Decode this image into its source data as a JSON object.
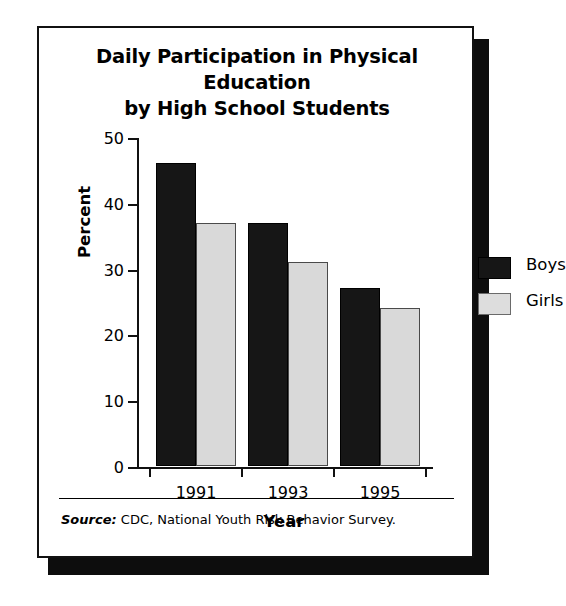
{
  "chart_data": {
    "type": "bar",
    "title": "Daily Participation in Physical Education by High School Students",
    "title_line_1": "Daily Participation in Physical Education",
    "title_line_2": "by High School Students",
    "xlabel": "Year",
    "ylabel": "Percent",
    "categories": [
      "1991",
      "1993",
      "1995"
    ],
    "series": [
      {
        "name": "Boys",
        "values": [
          46,
          37,
          27
        ],
        "color": "#161616"
      },
      {
        "name": "Girls",
        "values": [
          37,
          31,
          24
        ],
        "color": "#d9d9d9"
      }
    ],
    "ylim": [
      0,
      50
    ],
    "yticks": [
      0,
      10,
      20,
      30,
      40,
      50
    ],
    "ytick_labels": [
      "0",
      "10",
      "20",
      "30",
      "40",
      "50"
    ],
    "grid": false,
    "legend_position": "top-right",
    "source_keyword": "Source:",
    "source_text": " CDC, National Youth Risk Behavior Survey."
  },
  "legend": {
    "entries": [
      {
        "label": "Boys"
      },
      {
        "label": "Girls"
      }
    ]
  },
  "axis": {
    "y_title": "Percent",
    "x_title": "Year"
  }
}
